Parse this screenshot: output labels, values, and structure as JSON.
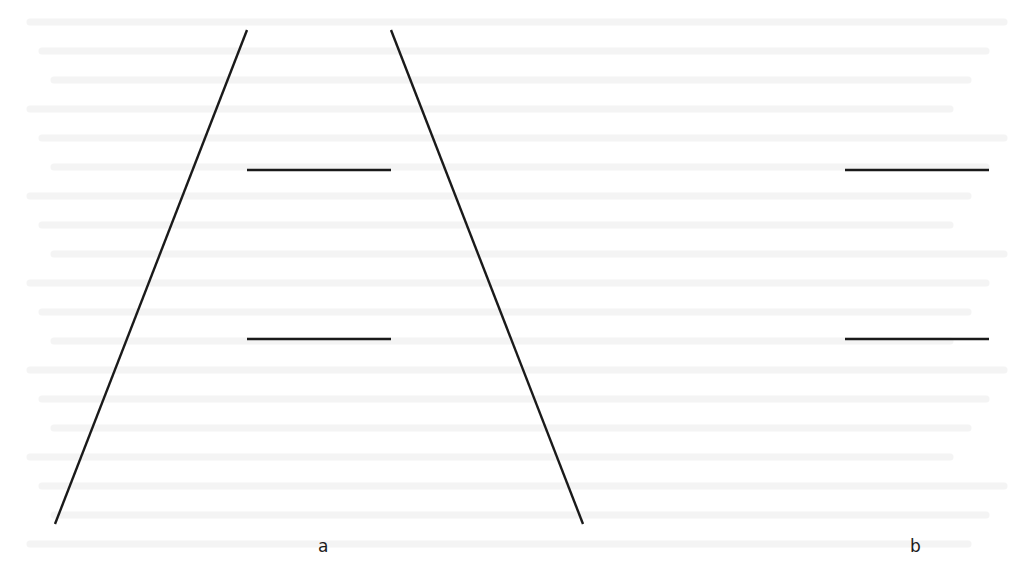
{
  "figure": {
    "panels": [
      {
        "label": "a",
        "label_pos": [
          318,
          538
        ],
        "converging_lines": [
          {
            "x1": 247,
            "y1": 30,
            "x2": 55,
            "y2": 524
          },
          {
            "x1": 391,
            "y1": 30,
            "x2": 583,
            "y2": 524
          }
        ],
        "horizontal_segments": [
          {
            "x1": 247,
            "y1": 170,
            "x2": 391,
            "y2": 170
          },
          {
            "x1": 247,
            "y1": 339,
            "x2": 391,
            "y2": 339
          }
        ]
      },
      {
        "label": "b",
        "label_pos": [
          910,
          538
        ],
        "converging_lines": [],
        "horizontal_segments": [
          {
            "x1": 845,
            "y1": 170,
            "x2": 989,
            "y2": 170
          },
          {
            "x1": 845,
            "y1": 339,
            "x2": 989,
            "y2": 339
          }
        ]
      }
    ],
    "line_color": "#1a1a1a",
    "background_color": "#ffffff",
    "bleed_through_text_color": "#ececec"
  }
}
